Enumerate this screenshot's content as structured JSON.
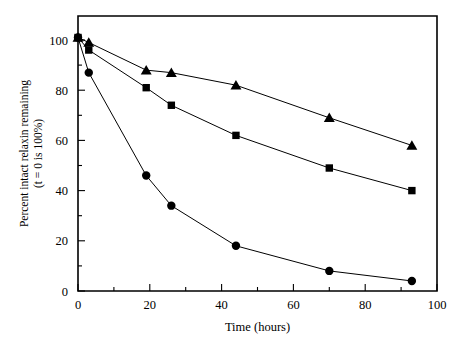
{
  "chart_data": {
    "type": "line",
    "title": "",
    "xlabel": "Time (hours)",
    "ylabel": "Percent intact relaxin remaining (t = 0 is 100%)",
    "ylabel_line1": "Percent intact relaxin remaining",
    "ylabel_line2": "(t = 0 is 100%)",
    "xlim": [
      0,
      100
    ],
    "ylim": [
      0,
      110
    ],
    "grid": false,
    "legend": "none",
    "x_ticks_major": [
      0,
      20,
      40,
      60,
      80,
      100
    ],
    "x_tick_labels": [
      "0",
      "20",
      "40",
      "60",
      "80",
      "100"
    ],
    "x_ticks_minor": [
      10,
      30,
      50,
      70,
      90
    ],
    "y_ticks_major": [
      0,
      20,
      40,
      60,
      80,
      100
    ],
    "y_tick_labels": [
      "0",
      "20",
      "40",
      "60",
      "80",
      "100"
    ],
    "y_ticks_minor": [
      10,
      30,
      50,
      70,
      90
    ],
    "series": [
      {
        "name": "triangle-series",
        "marker": "triangle",
        "x": [
          0,
          3,
          19,
          26,
          44,
          70,
          93
        ],
        "values": [
          101,
          99,
          88,
          87,
          82,
          69,
          58
        ]
      },
      {
        "name": "square-series",
        "marker": "square",
        "x": [
          0,
          3,
          19,
          26,
          44,
          70,
          93
        ],
        "values": [
          101,
          96,
          81,
          74,
          62,
          49,
          40
        ]
      },
      {
        "name": "circle-series",
        "marker": "circle",
        "x": [
          0,
          3,
          19,
          26,
          44,
          70,
          93
        ],
        "values": [
          101,
          87,
          46,
          34,
          18,
          8,
          4
        ]
      }
    ]
  },
  "colors": {
    "axis": "#000000",
    "series": "#000000",
    "background": "#ffffff"
  }
}
